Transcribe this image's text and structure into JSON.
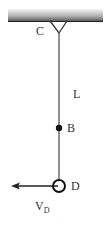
{
  "diagram": {
    "type": "pendulum",
    "ceiling": {
      "x": 8,
      "y": 9,
      "width": 95,
      "height": 13,
      "gradient_top": "#f2f2f2",
      "gradient_bottom": "#555555",
      "edge_color": "#222222"
    },
    "pivot": {
      "label": "C",
      "label_pos": [
        36,
        25
      ],
      "hook_left": [
        50,
        21
      ],
      "hook_right": [
        67,
        21
      ],
      "vertex": [
        59,
        33
      ]
    },
    "rod": {
      "label": "L",
      "label_pos": [
        73,
        88
      ],
      "x": 59,
      "y_start": 33,
      "y_end": 180,
      "color": "#555555"
    },
    "point_b": {
      "label": "B",
      "label_pos": [
        67,
        122
      ],
      "center": [
        59,
        128
      ],
      "radius": 3.2,
      "color": "#111111"
    },
    "bob_d": {
      "label": "D",
      "label_pos": [
        71,
        180
      ],
      "center": [
        59,
        186
      ],
      "radius": 6,
      "stroke": "#111111",
      "stroke_width": 2
    },
    "velocity": {
      "label_main": "V",
      "label_sub": "D",
      "label_pos": [
        35,
        200
      ],
      "from": [
        58,
        186
      ],
      "to": [
        12,
        186
      ],
      "direction": "left",
      "color": "#222222"
    }
  }
}
